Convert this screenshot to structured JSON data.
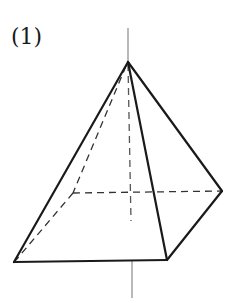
{
  "figure": {
    "label": "(1)",
    "colors": {
      "edge": "#1a1a1a",
      "axis": "#8a8a8a",
      "hidden": "#444444",
      "background": "#ffffff"
    },
    "vertices": {
      "apex": [
        128,
        62
      ],
      "front_left": [
        14,
        262
      ],
      "front_right": [
        167,
        260
      ],
      "back_right": [
        222,
        191
      ],
      "back_left": [
        73,
        193
      ]
    },
    "axis": {
      "top": [
        128,
        28
      ],
      "hidden_end": [
        131,
        221
      ],
      "bottom_start": [
        132,
        261
      ],
      "bottom": [
        132,
        298
      ]
    }
  }
}
